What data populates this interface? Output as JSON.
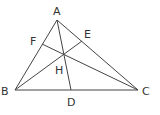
{
  "diagram": {
    "points": {
      "A": {
        "label": "A",
        "x": 57,
        "y": 20
      },
      "B": {
        "label": "B",
        "x": 15,
        "y": 90
      },
      "C": {
        "label": "C",
        "x": 138,
        "y": 90
      },
      "D": {
        "label": "D",
        "x": 71,
        "y": 90
      },
      "E": {
        "label": "E",
        "x": 82,
        "y": 41
      },
      "F": {
        "label": "F",
        "x": 42,
        "y": 44
      },
      "H": {
        "label": "H",
        "x": 64,
        "y": 54
      }
    },
    "labels": {
      "A": "A",
      "B": "B",
      "C": "C",
      "D": "D",
      "E": "E",
      "F": "F",
      "H": "H"
    },
    "segments": [
      "AB",
      "BC",
      "CA",
      "AD",
      "BE",
      "CF"
    ],
    "colors": {
      "line": "#444444",
      "text": "#333333",
      "background": "#ffffff"
    }
  }
}
